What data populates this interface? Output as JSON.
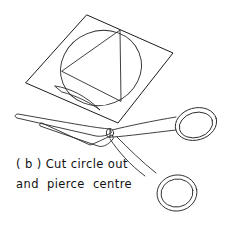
{
  "figure": {
    "label": "(b) Cut circle out and pierce centre",
    "background_color": "#ffffff",
    "ink_color": "#1b1b1b",
    "caption": {
      "line1": "( b ) Cut circle out",
      "line2": "and  pierce  centre",
      "line1_x": 16,
      "line1_y": 168,
      "line2_x": 16,
      "line2_y": 188
    },
    "shapes": {
      "paper_square": {
        "name": "tilted square sheet of paper",
        "points": "87,15 173,53 118,123 26,83"
      },
      "circle": {
        "name": "inscribed circle to be cut out",
        "cx": 101,
        "cy": 68,
        "rx": 41,
        "ry": 37,
        "rotation": -22
      },
      "triangle": {
        "name": "inscribed triangle with vertical right edge",
        "points": "62,71 120,30 121,101"
      }
    },
    "scissors": {
      "name": "pair of scissors",
      "pivot": {
        "cx": 110,
        "cy": 133,
        "r": 3.6
      },
      "blade_upper": "110,133 104,131 18,116 16,119 103,136",
      "blade_lower": "110,134 100,139 44,121 41,122 39,125 101,142",
      "upper_ring": {
        "cx": 196,
        "cy": 125,
        "rx": 20,
        "ry": 15,
        "rotation": -14
      },
      "lower_ring": {
        "cx": 177,
        "cy": 193,
        "rx": 19,
        "ry": 17,
        "rotation": -8
      },
      "handle_upper": "113,132 132,128 158,124 176,121",
      "handle_lower": "113,139 128,146 146,160 160,176"
    }
  }
}
